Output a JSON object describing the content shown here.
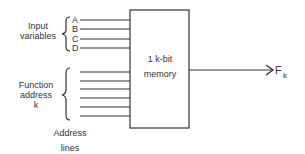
{
  "diagram": {
    "input_group": {
      "label_line1": "Input",
      "label_line2": "variables",
      "inputs": [
        "A",
        "B",
        "C",
        "D"
      ]
    },
    "address_group": {
      "label_line1": "Function",
      "label_line2": "address",
      "label_line3": "k",
      "line_count": 6
    },
    "memory_block": {
      "line1": "1 k-bit",
      "line2": "memory"
    },
    "output": {
      "label": "F",
      "subscript": "k"
    },
    "caption": {
      "line1": "Address",
      "line2": "lines"
    },
    "colors": {
      "stroke": "#333333",
      "background": "#ffffff"
    }
  }
}
